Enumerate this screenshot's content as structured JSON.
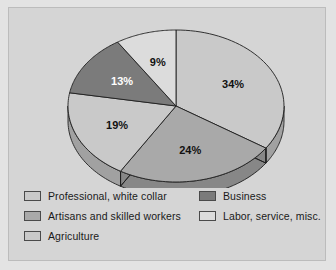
{
  "figure": {
    "background_color": "#e3e3e3",
    "plate_color": "#d5d5d5",
    "frame_color": "#bcbcbc"
  },
  "chart_data": {
    "type": "pie",
    "title": "",
    "subtitle": "",
    "xlabel": "",
    "ylabel": "",
    "three_d": true,
    "start_angle_oclock": 12,
    "direction": "clockwise",
    "legend_position": "bottom",
    "grid": false,
    "categories": [
      "Professional, white collar",
      "Artisans and skilled workers",
      "Agriculture",
      "Business",
      "Labor, service, misc."
    ],
    "values": [
      34,
      24,
      19,
      13,
      9
    ],
    "value_unit": "%",
    "slices": [
      {
        "label": "Professional, white collar",
        "value": 34,
        "display": "34%",
        "color": "#c9c9c9",
        "label_color": "#111111"
      },
      {
        "label": "Artisans and skilled workers",
        "value": 24,
        "display": "24%",
        "color": "#a9a9a9",
        "label_color": "#111111"
      },
      {
        "label": "Agriculture",
        "value": 19,
        "display": "19%",
        "color": "#c9c9c9",
        "label_color": "#111111"
      },
      {
        "label": "Business",
        "value": 13,
        "display": "13%",
        "color": "#7b7b7b",
        "label_color": "#ffffff"
      },
      {
        "label": "Labor, service, misc.",
        "value": 9,
        "display": "9%",
        "color": "#dcdcdc",
        "label_color": "#111111"
      }
    ]
  },
  "legend": {
    "columns": [
      {
        "items": [
          {
            "label": "Professional, white collar",
            "color": "#c9c9c9"
          },
          {
            "label": "Artisans and skilled workers",
            "color": "#a9a9a9"
          },
          {
            "label": "Agriculture",
            "color": "#c9c9c9"
          }
        ]
      },
      {
        "items": [
          {
            "label": "Business",
            "color": "#7b7b7b"
          },
          {
            "label": "Labor, service, misc.",
            "color": "#dcdcdc"
          }
        ]
      }
    ]
  }
}
